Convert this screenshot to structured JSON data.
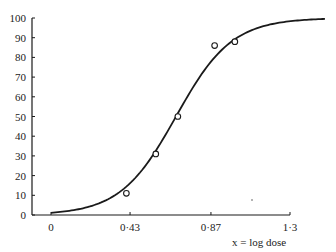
{
  "caption_cut": "… Logistic curve fitted to dose–response points (% effect) plotted against log dose …",
  "chart_data": {
    "type": "scatter",
    "title": "",
    "xlabel": "x = log dose",
    "ylabel": "",
    "xlim": [
      0,
      1.49
    ],
    "ylim": [
      0,
      100
    ],
    "x_ticks": [
      {
        "value": 0,
        "label": "0"
      },
      {
        "value": 0.43,
        "label": "0·43"
      },
      {
        "value": 0.87,
        "label": "0·87"
      },
      {
        "value": 1.3,
        "label": "1·3"
      }
    ],
    "y_ticks": [
      0,
      10,
      20,
      30,
      40,
      50,
      60,
      70,
      80,
      90,
      100
    ],
    "grid": false,
    "legend": null,
    "series": [
      {
        "name": "observed",
        "kind": "points",
        "marker": "open-circle",
        "x": [
          0.41,
          0.57,
          0.69,
          0.89,
          1.0
        ],
        "y": [
          11,
          31,
          50,
          86,
          88
        ]
      },
      {
        "name": "fitted logistic curve",
        "kind": "line",
        "model": "logistic",
        "midpoint": 0.68,
        "slope": 6.6,
        "x_range": [
          0,
          1.49
        ]
      }
    ]
  },
  "colors": {
    "ink": "#1a1a1a",
    "background": "#ffffff"
  }
}
